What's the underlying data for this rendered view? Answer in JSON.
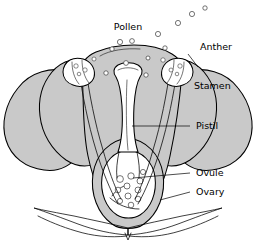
{
  "figure": {
    "background_color": "#ffffff",
    "ink_color": "#000000",
    "petal_fill": "#c9c9c9",
    "anther_fill": "#ffffff",
    "width": 256,
    "height": 250
  },
  "labels": {
    "pollen": "Pollen",
    "anther": "Anther",
    "stamen": "Stamen",
    "pistil": "Pistil",
    "ovule": "Ovule",
    "ovary": "Ovary"
  },
  "parts": [
    {
      "name": "pollen",
      "label": "Pollen",
      "label_x": 128,
      "label_y": 27,
      "has_leader": false
    },
    {
      "name": "anther",
      "label": "Anther",
      "label_x": 200,
      "label_y": 47,
      "has_leader": true
    },
    {
      "name": "stamen",
      "label": "Stamen",
      "label_x": 194,
      "label_y": 86,
      "has_leader": false
    },
    {
      "name": "pistil",
      "label": "Pistil",
      "label_x": 196,
      "label_y": 126,
      "has_leader": true
    },
    {
      "name": "ovule",
      "label": "Ovule",
      "label_x": 196,
      "label_y": 173,
      "has_leader": true
    },
    {
      "name": "ovary",
      "label": "Ovary",
      "label_x": 196,
      "label_y": 192,
      "has_leader": true
    }
  ],
  "pollen_grains": [
    {
      "cx": 120,
      "cy": 42,
      "r": 2.6
    },
    {
      "cx": 132,
      "cy": 41,
      "r": 2.4
    },
    {
      "cx": 112,
      "cy": 49,
      "r": 2.2
    },
    {
      "cx": 158,
      "cy": 34,
      "r": 2.6
    },
    {
      "cx": 178,
      "cy": 23,
      "r": 2.6
    },
    {
      "cx": 192,
      "cy": 14,
      "r": 2.6
    },
    {
      "cx": 205,
      "cy": 8,
      "r": 2.2
    },
    {
      "cx": 165,
      "cy": 48,
      "r": 2.2
    },
    {
      "cx": 181,
      "cy": 45,
      "r": 2.0
    },
    {
      "cx": 96,
      "cy": 60,
      "r": 2.4
    },
    {
      "cx": 126,
      "cy": 63,
      "r": 2.4
    },
    {
      "cx": 148,
      "cy": 58,
      "r": 2.0
    }
  ],
  "ovules": [
    {
      "cx": 120,
      "cy": 179,
      "r": 3.4
    },
    {
      "cx": 131,
      "cy": 176,
      "r": 3.2
    },
    {
      "cx": 140,
      "cy": 181,
      "r": 3.0
    },
    {
      "cx": 127,
      "cy": 186,
      "r": 3.0
    },
    {
      "cx": 138,
      "cy": 190,
      "r": 3.0
    },
    {
      "cx": 118,
      "cy": 190,
      "r": 2.8
    },
    {
      "cx": 128,
      "cy": 196,
      "r": 3.0
    },
    {
      "cx": 138,
      "cy": 199,
      "r": 2.8
    },
    {
      "cx": 120,
      "cy": 201,
      "r": 2.6
    },
    {
      "cx": 131,
      "cy": 205,
      "r": 2.8
    },
    {
      "cx": 143,
      "cy": 172,
      "r": 2.6
    }
  ]
}
